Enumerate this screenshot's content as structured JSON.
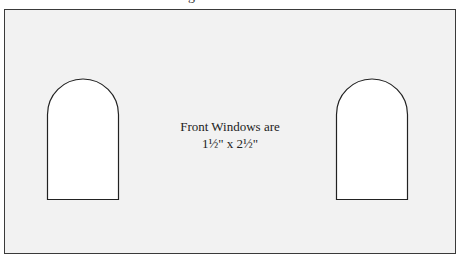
{
  "header": {
    "cut_text": "g"
  },
  "panel": {
    "background": "#f2f2f2",
    "border_color": "#3a3a3a"
  },
  "caption": {
    "line1": "Front Windows are",
    "line2": "1½\" x 2½\""
  },
  "windows": [
    {
      "name": "left-window",
      "x": 47,
      "y": 79,
      "width": 71,
      "height": 120
    },
    {
      "name": "right-window",
      "x": 336,
      "y": 79,
      "width": 71,
      "height": 120
    }
  ]
}
